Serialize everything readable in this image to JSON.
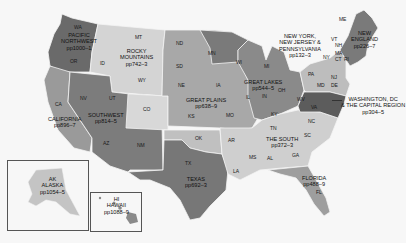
{
  "map": {
    "colors": {
      "background": "#f7f7f7",
      "pacific_northwest": "#6a6a6a",
      "rocky_mountains": "#d4d4d4",
      "california": "#9a9a9a",
      "southwest": "#7c7c7c",
      "great_plains": "#a8a8a8",
      "great_lakes": "#8a8a8a",
      "texas": "#777777",
      "the_south": "#cfcfcf",
      "florida": "#9e9e9e",
      "ny_nj_pa": "#bdbdbd",
      "new_england": "#7a7a7a",
      "washington_dc": "#5c5c5c",
      "alaska": "#c4c4c4",
      "hawaii": "#8a8a8a"
    },
    "regions": [
      {
        "id": "pacific-northwest",
        "name": "PACIFIC\nNORTHWEST",
        "pages": "pp1000–1"
      },
      {
        "id": "rocky-mountains",
        "name": "ROCKY\nMOUNTAINS",
        "pages": "pp742–3"
      },
      {
        "id": "california",
        "name": "CALIFORNIA",
        "pages": "pp896–7"
      },
      {
        "id": "southwest",
        "name": "SOUTHWEST",
        "pages": "pp814–5"
      },
      {
        "id": "great-plains",
        "name": "GREAT PLAINS",
        "pages": "pp638–9"
      },
      {
        "id": "great-lakes",
        "name": "GREAT LAKES",
        "pages": "pp544–5"
      },
      {
        "id": "texas",
        "name": "TEXAS",
        "pages": "pp692–3"
      },
      {
        "id": "the-south",
        "name": "THE SOUTH",
        "pages": "pp372–3"
      },
      {
        "id": "florida",
        "name": "FLORIDA",
        "pages": "pp488–9"
      },
      {
        "id": "ny-nj-pa",
        "name": "NEW YORK,\nNEW JERSEY &\nPENNSYLVANIA",
        "pages": "pp132–3"
      },
      {
        "id": "new-england",
        "name": "NEW\nENGLAND",
        "pages": "pp226–7"
      },
      {
        "id": "washington-dc",
        "name": "WASHINGTON, DC\n& THE CAPITAL REGION",
        "pages": "pp304–5"
      },
      {
        "id": "alaska",
        "name": "ALASKA",
        "pages": "pp1054–5"
      },
      {
        "id": "hawaii",
        "name": "HAWAII",
        "pages": "pp1088–9"
      }
    ],
    "region_labels": {
      "pacific_northwest": {
        "line1": "PACIFIC",
        "line2": "NORTHWEST",
        "pages": "pp1000–1"
      },
      "rocky_mountains": {
        "line1": "ROCKY",
        "line2": "MOUNTAINS",
        "pages": "pp742–3"
      },
      "california": {
        "line1": "CALIFORNIA",
        "pages": "pp896–7"
      },
      "southwest": {
        "line1": "SOUTHWEST",
        "pages": "pp814–5"
      },
      "great_plains": {
        "line1": "GREAT PLAINS",
        "pages": "pp638–9"
      },
      "great_lakes": {
        "line1": "GREAT LAKES",
        "pages": "pp544–5"
      },
      "texas": {
        "line1": "TEXAS",
        "pages": "pp692–3"
      },
      "the_south": {
        "line1": "THE SOUTH",
        "pages": "pp372–3"
      },
      "florida": {
        "line1": "FLORIDA",
        "pages": "pp488–9"
      },
      "ny_nj_pa": {
        "line1": "NEW YORK,",
        "line2": "NEW JERSEY &",
        "line3": "PENNSYLVANIA",
        "pages": "pp132–3"
      },
      "new_england": {
        "line1": "NEW",
        "line2": "ENGLAND",
        "pages": "pp226–7"
      },
      "washington_dc": {
        "line1": "WASHINGTON, DC",
        "line2": "& THE CAPITAL REGION",
        "pages": "pp304–5"
      },
      "alaska": {
        "abbr": "AK",
        "line1": "ALASKA",
        "pages": "pp1054–5"
      },
      "hawaii": {
        "abbr": "HI",
        "line1": "HAWAII",
        "pages": "pp1088–9"
      }
    },
    "state_abbreviations": {
      "wa": "WA",
      "or": "OR",
      "id": "ID",
      "mt": "MT",
      "wy": "WY",
      "ca": "CA",
      "nv": "NV",
      "ut": "UT",
      "co": "CO",
      "az": "AZ",
      "nm": "NM",
      "nd": "ND",
      "sd": "SD",
      "ne": "NE",
      "ks": "KS",
      "ok": "OK",
      "tx": "TX",
      "mn": "MN",
      "ia": "IA",
      "mo": "MO",
      "ar": "AR",
      "la": "LA",
      "wi": "WI",
      "il": "IL",
      "mi": "MI",
      "in": "IN",
      "oh": "OH",
      "ky": "KY",
      "tn": "TN",
      "ms": "MS",
      "al": "AL",
      "ga": "GA",
      "fl": "FL",
      "sc": "SC",
      "nc": "NC",
      "va": "VA",
      "wv": "WV",
      "md": "MD",
      "de": "DE",
      "pa": "PA",
      "nj": "NJ",
      "ny": "NY",
      "vt": "VT",
      "nh": "NH",
      "me": "ME",
      "ma": "MA",
      "ct": "CT",
      "ri": "RI"
    }
  }
}
